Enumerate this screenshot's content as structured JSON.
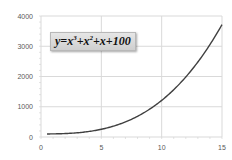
{
  "chart_data": {
    "type": "line",
    "title": "",
    "annotation": "y=x³+x²+x+100",
    "equation": {
      "prefix": "y=x",
      "exp1": "3",
      "mid1": "+x",
      "exp2": "2",
      "suffix": "+x+100"
    },
    "xlabel": "",
    "ylabel": "",
    "xlim": [
      0,
      15
    ],
    "ylim": [
      0,
      4000
    ],
    "x_ticks": [
      0,
      5,
      10,
      15
    ],
    "y_ticks": [
      0,
      1000,
      2000,
      3000,
      4000
    ],
    "grid": true,
    "legend": "none",
    "series": [
      {
        "name": "y=x^3+x^2+x+100",
        "color": "#404040",
        "x": [
          0.5,
          1,
          2,
          3,
          4,
          5,
          6,
          7,
          8,
          9,
          10,
          11,
          12,
          13,
          14,
          15
        ],
        "values": [
          100.9,
          103,
          114,
          139,
          184,
          255,
          358,
          499,
          684,
          919,
          1210,
          1563,
          1984,
          2479,
          3054,
          3715
        ]
      }
    ]
  },
  "axis": {
    "x_labels": [
      "0",
      "5",
      "10",
      "15"
    ],
    "y_labels": [
      "0",
      "1000",
      "2000",
      "3000",
      "4000"
    ]
  }
}
